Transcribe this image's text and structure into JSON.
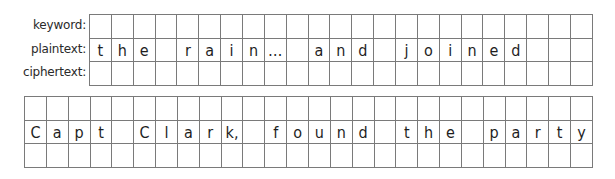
{
  "grid1": {
    "labels": [
      "keyword:",
      "plaintext:",
      "ciphertext:"
    ],
    "columns": 23,
    "rows": [
      [
        "",
        "",
        "",
        "",
        "",
        "",
        "",
        "",
        "",
        "",
        "",
        "",
        "",
        "",
        "",
        "",
        "",
        "",
        "",
        "",
        "",
        "",
        ""
      ],
      [
        "t",
        "h",
        "e",
        "",
        "r",
        "a",
        "i",
        "n",
        "…",
        "",
        "a",
        "n",
        "d",
        "",
        "j",
        "o",
        "i",
        "n",
        "e",
        "d",
        "",
        "",
        ""
      ],
      [
        "",
        "",
        "",
        "",
        "",
        "",
        "",
        "",
        "",
        "",
        "",
        "",
        "",
        "",
        "",
        "",
        "",
        "",
        "",
        "",
        "",
        "",
        ""
      ]
    ]
  },
  "grid2": {
    "columns": 26,
    "rows": [
      [
        "",
        "",
        "",
        "",
        "",
        "",
        "",
        "",
        "",
        "",
        "",
        "",
        "",
        "",
        "",
        "",
        "",
        "",
        "",
        "",
        "",
        "",
        "",
        "",
        "",
        ""
      ],
      [
        "C",
        "a",
        "p",
        "t",
        "",
        "C",
        "l",
        "a",
        "r",
        "k,",
        "",
        "f",
        "o",
        "u",
        "n",
        "d",
        "",
        "t",
        "h",
        "e",
        "",
        "p",
        "a",
        "r",
        "t",
        "y"
      ],
      [
        "",
        "",
        "",
        "",
        "",
        "",
        "",
        "",
        "",
        "",
        "",
        "",
        "",
        "",
        "",
        "",
        "",
        "",
        "",
        "",
        "",
        "",
        "",
        "",
        "",
        ""
      ]
    ]
  }
}
